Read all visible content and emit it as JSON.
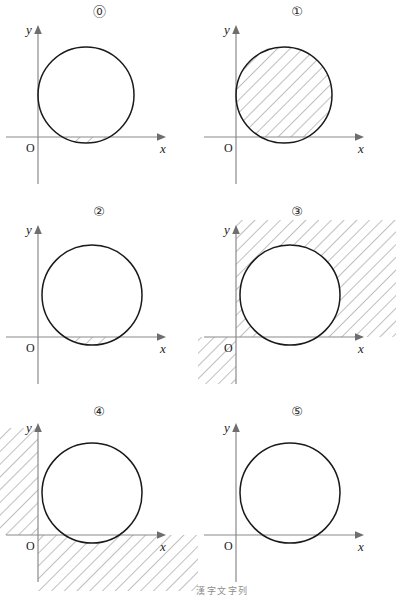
{
  "figure": {
    "type": "math-diagram-grid",
    "columns": 2,
    "rows": 3,
    "background_color": "#ffffff",
    "stroke_color": "#1a1a1a",
    "axis_color": "#808080",
    "hatch_color": "#8a8a8a"
  },
  "axis_labels": {
    "x": "x",
    "y": "y",
    "origin": "O"
  },
  "panels": [
    {
      "label": "⓪",
      "label_plain": "0",
      "circle": {
        "cx": 86,
        "cy": 95,
        "r": 48,
        "tangent_to_y_axis": true
      },
      "origin": {
        "x": 38,
        "y": 137
      },
      "shading": "inside circle, below the x-axis (lower circular segment)",
      "shaded_regions": [
        "circle-below-x-axis"
      ]
    },
    {
      "label": "①",
      "label_plain": "1",
      "circle": {
        "cx": 86,
        "cy": 95,
        "r": 48,
        "tangent_to_y_axis": true
      },
      "origin": {
        "x": 38,
        "y": 137
      },
      "shading": "inside circle, above the x-axis (upper circular segment)",
      "shaded_regions": [
        "circle-above-x-axis"
      ]
    },
    {
      "label": "②",
      "label_plain": "2",
      "circle": {
        "cx": 92,
        "cy": 95,
        "r": 50,
        "tangent_to_y_axis": false
      },
      "origin": {
        "x": 38,
        "y": 137
      },
      "shading": "inside circle below the x-axis, plus the thin lune left of the y-axis above the x-axis",
      "shaded_regions": [
        "circle-below-x-axis",
        "circle-left-lune-above-x-axis"
      ]
    },
    {
      "label": "③",
      "label_plain": "3",
      "circle": {
        "cx": 92,
        "cy": 95,
        "r": 50,
        "tangent_to_y_axis": false
      },
      "origin": {
        "x": 38,
        "y": 137
      },
      "shading": "outside the circle: first-quadrant region (x>0, y>0) and third-quadrant region (x<0, y<0)",
      "shaded_regions": [
        "quadrant-I-outside-circle",
        "quadrant-III-outside-circle"
      ]
    },
    {
      "label": "④",
      "label_plain": "4",
      "circle": {
        "cx": 92,
        "cy": 95,
        "r": 50,
        "tangent_to_y_axis": false
      },
      "origin": {
        "x": 38,
        "y": 137
      },
      "shading": "outside the circle: second-quadrant region (x<0, y>0) and fourth-quadrant region (x>0, y<0)",
      "shaded_regions": [
        "quadrant-II-outside-circle",
        "quadrant-IV-outside-circle"
      ]
    },
    {
      "label": "⑤",
      "label_plain": "5",
      "circle": {
        "cx": 92,
        "cy": 95,
        "r": 50,
        "tangent_to_y_axis": false
      },
      "origin": {
        "x": 38,
        "y": 137
      },
      "shading": "only the thin lune between the y-axis and the circle's left arc, above the x-axis",
      "shaded_regions": [
        "circle-left-lune-above-x-axis"
      ]
    }
  ],
  "footnote": {
    "text": "漢字文字列",
    "visible": "partially cut off at bottom edge"
  }
}
